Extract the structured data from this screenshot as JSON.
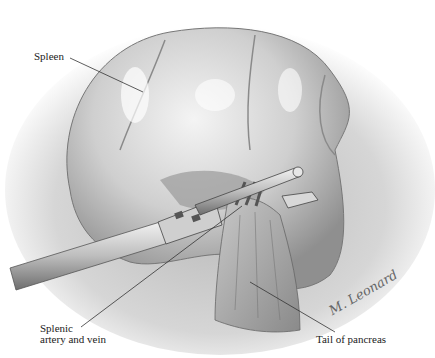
{
  "figure": {
    "type": "medical-illustration",
    "labels": {
      "spleen": "Spleen",
      "splenic_artery_line1": "Splenic",
      "splenic_artery_line2": "artery and vein",
      "tail_of_pancreas": "Tail of pancreas"
    },
    "signature": "M. Leonard",
    "colors": {
      "background": "#ffffff",
      "organ_light": "#e6e6e6",
      "organ_mid": "#bdbdbd",
      "organ_dark": "#6a6a6a",
      "leader_line": "#333333"
    }
  }
}
